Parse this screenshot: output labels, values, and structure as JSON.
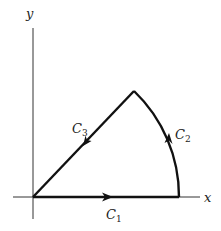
{
  "diagram": {
    "type": "contour-diagram",
    "axes": {
      "x_label": "x",
      "y_label": "y"
    },
    "curves": [
      {
        "name": "C",
        "subscript": "1",
        "kind": "segment",
        "from": "origin",
        "to": "(R,0)",
        "direction": "right"
      },
      {
        "name": "C",
        "subscript": "2",
        "kind": "arc",
        "from": "(R,0)",
        "to": "apex at ~45°",
        "direction": "counterclockwise"
      },
      {
        "name": "C",
        "subscript": "3",
        "kind": "segment",
        "from": "apex",
        "to": "origin",
        "direction": "toward origin"
      }
    ],
    "colors": {
      "line": "#111111",
      "axis": "#333333",
      "background": "#ffffff"
    }
  }
}
